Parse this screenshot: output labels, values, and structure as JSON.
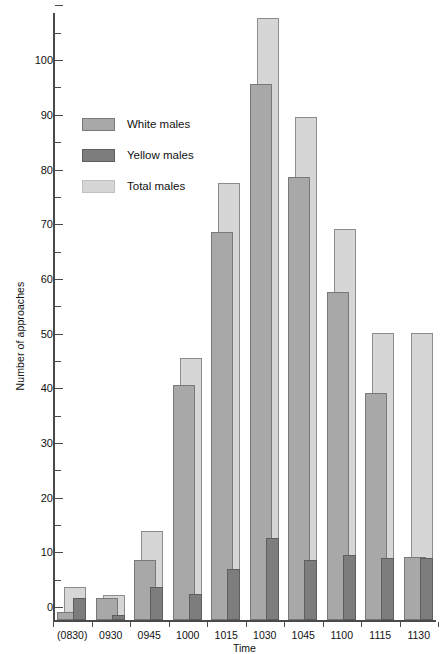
{
  "chart_data": {
    "type": "bar",
    "title": "",
    "xlabel": "Time",
    "ylabel": "Number of approaches",
    "ylim": [
      0,
      111
    ],
    "ytick_major_step": 10,
    "ytick_minor_step": 5,
    "grid": false,
    "legend_position": "upper-left-inside",
    "bar_style": "overlapping-grouped",
    "categories": [
      "(0830)",
      "0930",
      "0945",
      "1000",
      "1015",
      "1030",
      "1045",
      "1100",
      "1115",
      "1130"
    ],
    "series": [
      {
        "name": "White males",
        "color": "#a8a8a8",
        "values": [
          1.5,
          4,
          11,
          43,
          71,
          98,
          81,
          60,
          41.5,
          11.5
        ]
      },
      {
        "name": "Yellow males",
        "color": "#7d7d7d",
        "values": [
          4,
          1,
          6,
          4.8,
          9.3,
          15,
          11,
          11.8,
          11.3,
          11.3
        ]
      },
      {
        "name": "Total males",
        "color": "#d6d6d6",
        "values": [
          6,
          4.5,
          16.3,
          48,
          80,
          110,
          92,
          71.5,
          52.5,
          52.5
        ]
      }
    ],
    "ytick_labels": [
      "0",
      "10",
      "20",
      "30",
      "40",
      "50",
      "60",
      "70",
      "80",
      "90",
      "100"
    ],
    "ytick_values": [
      0,
      10,
      20,
      30,
      40,
      50,
      60,
      70,
      80,
      90,
      100
    ]
  },
  "legend": {
    "items": [
      {
        "label": "White males",
        "swatch": "s-white"
      },
      {
        "label": "Yellow males",
        "swatch": "s-yellow"
      },
      {
        "label": "Total males",
        "swatch": "s-total"
      }
    ]
  },
  "axes": {
    "y_title": "Number of approaches",
    "x_title": "Time"
  }
}
